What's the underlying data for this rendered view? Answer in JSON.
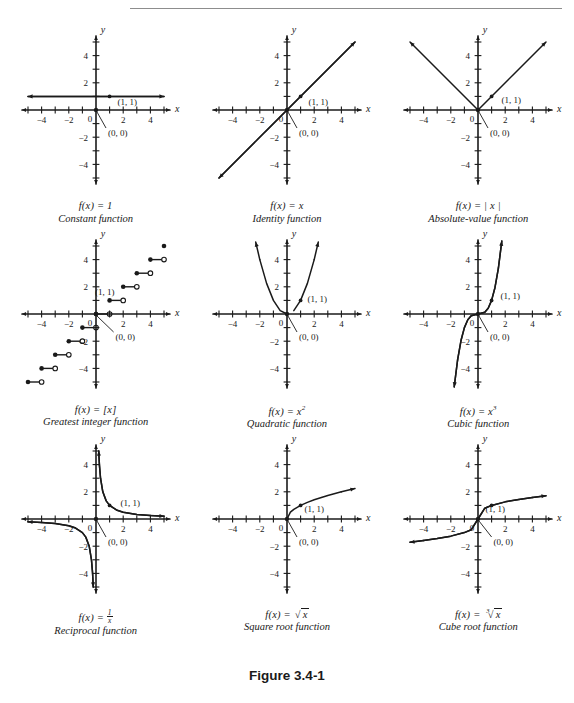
{
  "figure": {
    "caption": "Figure 3.4-1"
  },
  "axes": {
    "x_label": "x",
    "y_label": "y",
    "origin_label": "0",
    "x_ticks": [
      -4,
      -2,
      2,
      4
    ],
    "y_ticks": [
      -4,
      -2,
      2,
      4
    ],
    "x_tick_labels": [
      "−4",
      "−2",
      "2",
      "4"
    ],
    "y_tick_labels": [
      "−4",
      "−2",
      "2",
      "4"
    ],
    "range": [
      -5.5,
      5.5
    ]
  },
  "annotations": {
    "point_one_one": "(1, 1)",
    "point_origin": "(0, 0)"
  },
  "chart_data": [
    {
      "id": "constant",
      "type": "line",
      "title": "f(x) = 1",
      "name": "Constant function",
      "formula_text": "f(x) = 1",
      "xlabel": "x",
      "ylabel": "y",
      "xlim": [
        -5.5,
        5.5
      ],
      "ylim": [
        -5.5,
        5.5
      ],
      "grid": false,
      "legend": "none",
      "marked_points": [
        [
          1,
          1
        ],
        [
          0,
          0
        ]
      ],
      "x": [
        -5,
        5
      ],
      "values": [
        1,
        1
      ]
    },
    {
      "id": "identity",
      "type": "line",
      "title": "f(x) = x",
      "name": "Identity function",
      "formula_text": "f(x) = x",
      "xlabel": "x",
      "ylabel": "y",
      "xlim": [
        -5.5,
        5.5
      ],
      "ylim": [
        -5.5,
        5.5
      ],
      "grid": false,
      "legend": "none",
      "marked_points": [
        [
          1,
          1
        ],
        [
          0,
          0
        ]
      ],
      "x": [
        -5,
        5
      ],
      "values": [
        -5,
        5
      ]
    },
    {
      "id": "absolute-value",
      "type": "line",
      "title": "f(x) = | x |",
      "name": "Absolute-value function",
      "formula_text": "f(x) = | x |",
      "xlabel": "x",
      "ylabel": "y",
      "xlim": [
        -5.5,
        5.5
      ],
      "ylim": [
        -5.5,
        5.5
      ],
      "grid": false,
      "legend": "none",
      "marked_points": [
        [
          1,
          1
        ],
        [
          0,
          0
        ]
      ],
      "x": [
        -5,
        0,
        5
      ],
      "values": [
        5,
        0,
        5
      ]
    },
    {
      "id": "greatest-integer",
      "type": "line",
      "title": "f(x) = [x]",
      "name": "Greatest integer function",
      "formula_text": "f(x) = [x]",
      "xlabel": "x",
      "ylabel": "y",
      "xlim": [
        -5.5,
        5.5
      ],
      "ylim": [
        -5.5,
        5.5
      ],
      "grid": false,
      "legend": "none",
      "marked_points": [
        [
          1,
          1
        ],
        [
          0,
          0
        ]
      ],
      "steps": [
        {
          "x0": -5,
          "x1": -4,
          "y": -5
        },
        {
          "x0": -4,
          "x1": -3,
          "y": -4
        },
        {
          "x0": -3,
          "x1": -2,
          "y": -3
        },
        {
          "x0": -2,
          "x1": -1,
          "y": -2
        },
        {
          "x0": -1,
          "x1": 0,
          "y": -1
        },
        {
          "x0": 0,
          "x1": 1,
          "y": 0
        },
        {
          "x0": 1,
          "x1": 2,
          "y": 1
        },
        {
          "x0": 2,
          "x1": 3,
          "y": 2
        },
        {
          "x0": 3,
          "x1": 4,
          "y": 3
        },
        {
          "x0": 4,
          "x1": 5,
          "y": 4
        }
      ]
    },
    {
      "id": "quadratic",
      "type": "line",
      "title": "f(x) = x²",
      "name": "Quadratic function",
      "formula_text": "f(x) = x",
      "formula_exponent": "2",
      "xlabel": "x",
      "ylabel": "y",
      "xlim": [
        -5.5,
        5.5
      ],
      "ylim": [
        -5.5,
        5.5
      ],
      "grid": false,
      "legend": "none",
      "marked_points": [
        [
          1,
          1
        ],
        [
          0,
          0
        ]
      ],
      "x": [
        -2.3,
        -2,
        -1.5,
        -1,
        -0.5,
        0,
        0.5,
        1,
        1.5,
        2,
        2.3
      ],
      "values": [
        5.29,
        4,
        2.25,
        1,
        0.25,
        0,
        0.25,
        1,
        2.25,
        4,
        5.29
      ]
    },
    {
      "id": "cubic",
      "type": "line",
      "title": "f(x) = x³",
      "name": "Cubic function",
      "formula_text": "f(x) = x",
      "formula_exponent": "3",
      "xlabel": "x",
      "ylabel": "y",
      "xlim": [
        -5.5,
        5.5
      ],
      "ylim": [
        -5.5,
        5.5
      ],
      "grid": false,
      "legend": "none",
      "marked_points": [
        [
          1,
          1
        ],
        [
          0,
          0
        ]
      ],
      "x": [
        -1.75,
        -1.5,
        -1.25,
        -1,
        -0.75,
        -0.5,
        0,
        0.5,
        0.75,
        1,
        1.25,
        1.5,
        1.75
      ],
      "values": [
        -5.36,
        -3.38,
        -1.95,
        -1,
        -0.42,
        -0.13,
        0,
        0.13,
        0.42,
        1,
        1.95,
        3.38,
        5.36
      ]
    },
    {
      "id": "reciprocal",
      "type": "line",
      "title": "f(x) = 1/x",
      "name": "Reciprocal function",
      "formula_text": "f(x) = ",
      "formula_numerator": "1",
      "formula_denominator": "x",
      "xlabel": "x",
      "ylabel": "y",
      "xlim": [
        -5.5,
        5.5
      ],
      "ylim": [
        -5.5,
        5.5
      ],
      "grid": false,
      "legend": "none",
      "marked_points": [
        [
          1,
          1
        ],
        [
          0,
          0
        ]
      ],
      "branch_positive_x": [
        0.2,
        0.25,
        0.333,
        0.5,
        0.75,
        1,
        1.5,
        2,
        3,
        4,
        5
      ],
      "branch_positive_y": [
        5,
        4,
        3,
        2,
        1.333,
        1,
        0.667,
        0.5,
        0.333,
        0.25,
        0.2
      ],
      "branch_negative_x": [
        -5,
        -4,
        -3,
        -2,
        -1.5,
        -1,
        -0.75,
        -0.5,
        -0.333,
        -0.25,
        -0.2
      ],
      "branch_negative_y": [
        -0.2,
        -0.25,
        -0.333,
        -0.5,
        -0.667,
        -1,
        -1.333,
        -2,
        -3,
        -4,
        -5
      ]
    },
    {
      "id": "square-root",
      "type": "line",
      "title": "f(x) = √x",
      "name": "Square root function",
      "formula_text": "f(x) = ",
      "radicand": "x",
      "radical_index": "",
      "xlabel": "x",
      "ylabel": "y",
      "xlim": [
        -5.5,
        5.5
      ],
      "ylim": [
        -5.5,
        5.5
      ],
      "grid": false,
      "legend": "none",
      "marked_points": [
        [
          1,
          1
        ],
        [
          0,
          0
        ]
      ],
      "x": [
        0,
        0.25,
        0.5,
        1,
        1.5,
        2,
        3,
        4,
        5
      ],
      "values": [
        0,
        0.5,
        0.707,
        1,
        1.225,
        1.414,
        1.732,
        2,
        2.236
      ]
    },
    {
      "id": "cube-root",
      "type": "line",
      "title": "f(x) = ∛ x",
      "name": "Cube root function",
      "formula_text": "f(x) = ",
      "radicand": "x",
      "radical_index": "3",
      "xlabel": "x",
      "ylabel": "y",
      "xlim": [
        -5.5,
        5.5
      ],
      "ylim": [
        -5.5,
        5.5
      ],
      "grid": false,
      "legend": "none",
      "marked_points": [
        [
          1,
          1
        ],
        [
          0,
          0
        ]
      ],
      "x": [
        -5,
        -4,
        -3,
        -2,
        -1,
        -0.5,
        0,
        0.5,
        1,
        2,
        3,
        4,
        5
      ],
      "values": [
        -1.71,
        -1.587,
        -1.442,
        -1.26,
        -1,
        -0.794,
        0,
        0.794,
        1,
        1.26,
        1.442,
        1.587,
        1.71
      ]
    }
  ]
}
